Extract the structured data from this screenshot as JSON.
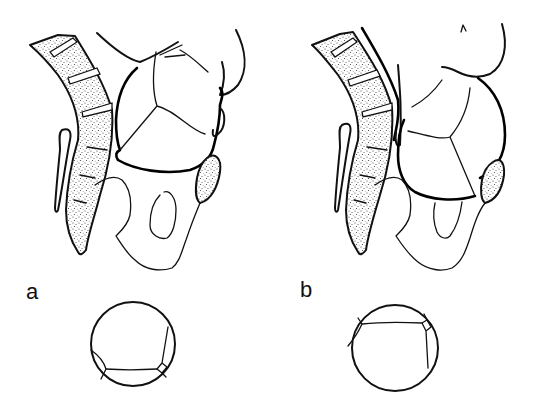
{
  "figure": {
    "panels": [
      {
        "id": "a",
        "label": "a",
        "description": "Sagittal section of pelvis with fetal head, sacrum and coccyx (stippled), pubic symphysis (stippled oval); below, circular view of fetal skull sutures"
      },
      {
        "id": "b",
        "label": "b",
        "description": "Sagittal section of pelvis with fetal head in altered position, sacrum and coccyx (stippled), pubic symphysis (stippled oval); below, circular view of fetal skull sutures rotated"
      }
    ],
    "colors": {
      "line": "#111111",
      "stipple": "#555555",
      "background": "#ffffff"
    }
  }
}
